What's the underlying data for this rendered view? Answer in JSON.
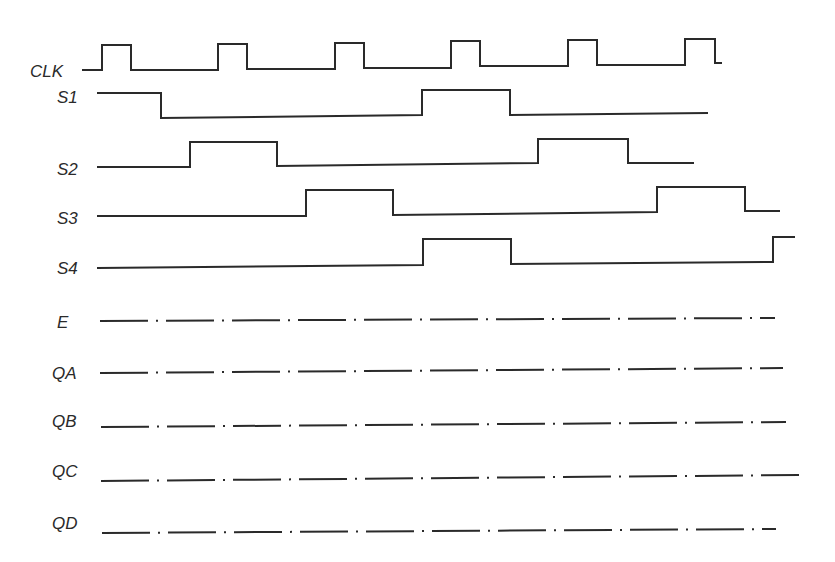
{
  "diagram": {
    "type": "timing-diagram",
    "stroke_color": "#2a2a2a",
    "background": "#ffffff",
    "signals": [
      {
        "name": "CLK",
        "label_x": 30,
        "label_y": 77,
        "style": "digital",
        "points": "82,70 102,70 102,45 131,45 131,70 218,70 218,44 247,44 247,69 335,69 335,43 364,43 364,68 451,68 451,41 480,41 480,66 568,66 568,40 597,40 597,65 685,65 685,39 715,39 715,63 722,63"
      },
      {
        "name": "S1",
        "label_x": 57,
        "label_y": 103,
        "style": "digital",
        "points": "97,93 161,93 161,118 422,115 422,90 510,90 510,115 708,113"
      },
      {
        "name": "S2",
        "label_x": 57,
        "label_y": 175,
        "style": "digital",
        "points": "97,167 190,167 190,142 277,142 277,166 538,163 538,139 628,139 628,163 694,163"
      },
      {
        "name": "S3",
        "label_x": 57,
        "label_y": 224,
        "style": "digital",
        "points": "97,216 306,216 306,190 393,190 393,215 657,212 657,187 745,187 745,211 780,211"
      },
      {
        "name": "S4",
        "label_x": 57,
        "label_y": 274,
        "style": "digital",
        "points": "97,268 423,265 423,239 511,239 511,264 773,262 773,237 795,237"
      },
      {
        "name": "E",
        "label_x": 57,
        "label_y": 328,
        "style": "dash-dot",
        "x1": 100,
        "y1": 321,
        "x2": 775,
        "y2": 318
      },
      {
        "name": "QA",
        "label_x": 52,
        "label_y": 379,
        "style": "dash-dot",
        "x1": 100,
        "y1": 373,
        "x2": 783,
        "y2": 368
      },
      {
        "name": "QB",
        "label_x": 52,
        "label_y": 427,
        "style": "dash-dot",
        "x1": 101,
        "y1": 427,
        "x2": 786,
        "y2": 422
      },
      {
        "name": "QC",
        "label_x": 52,
        "label_y": 477,
        "style": "dash-dot",
        "x1": 101,
        "y1": 481,
        "x2": 799,
        "y2": 475
      },
      {
        "name": "QD",
        "label_x": 52,
        "label_y": 529,
        "style": "dash-dot",
        "x1": 102,
        "y1": 533,
        "x2": 776,
        "y2": 529
      }
    ]
  }
}
